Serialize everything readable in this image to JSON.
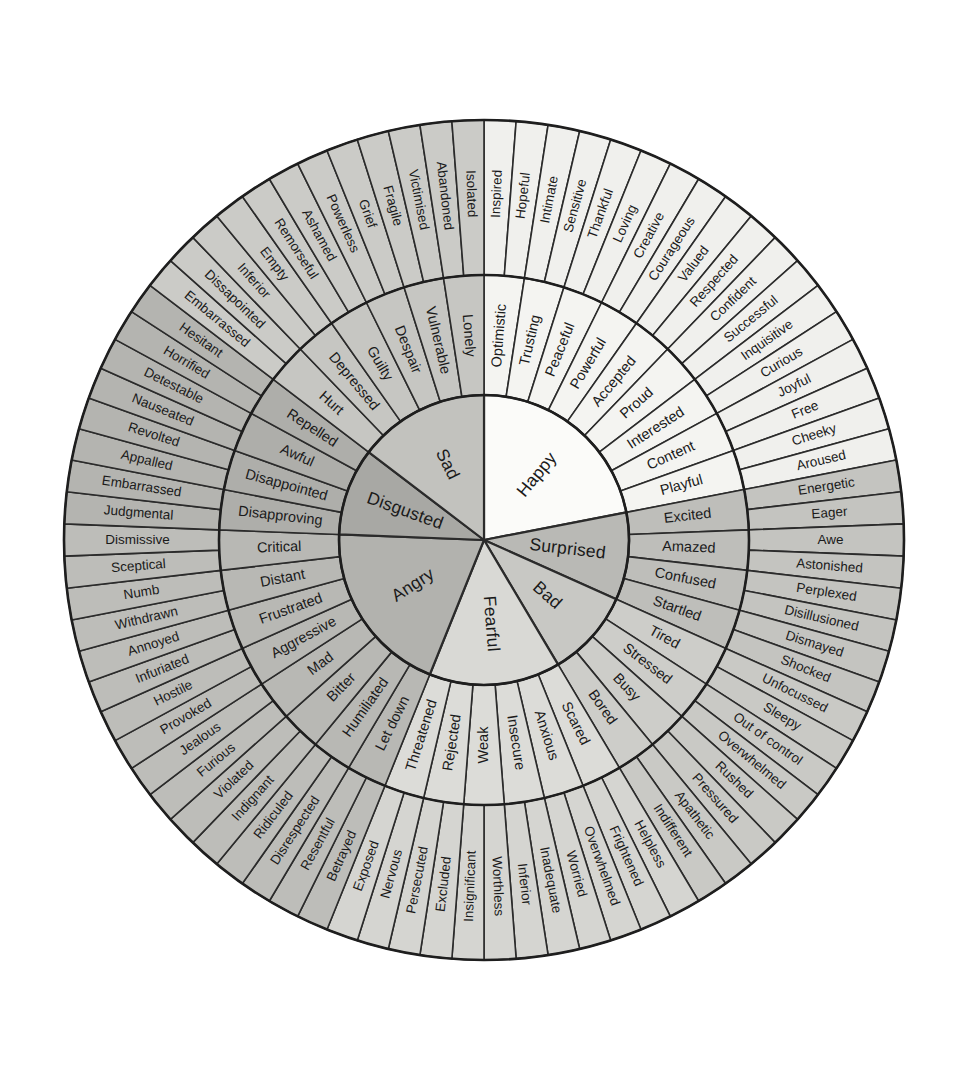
{
  "diagram": {
    "type": "radial-hierarchy",
    "rings": [
      "core",
      "middle",
      "outer"
    ],
    "center": {
      "x": 484,
      "y": 540
    },
    "radii": {
      "core": 145,
      "middle": 265,
      "outer": 420
    },
    "start_angle_deg": -90,
    "palette": {
      "happy": "#fbfbf9",
      "surprised": "#b9b9b5",
      "bad": "#c8c8c4",
      "fearful": "#d9d9d5",
      "angry": "#b2b2ae",
      "disgusted": "#a8a8a4",
      "sad": "#c2c2be",
      "stroke": "#2b2b2b",
      "background": "#ffffff",
      "text": "#1a1a1a"
    },
    "sectors": [
      {
        "core": "Happy",
        "fill": "#fbfbf9",
        "middle_fill": "#f4f4f1",
        "outer_fill": "#f0f0ed",
        "middle": [
          {
            "label": "Optimistic",
            "outer": [
              "Inspired",
              "Hopeful"
            ]
          },
          {
            "label": "Trusting",
            "outer": [
              "Intimate",
              "Sensitive"
            ]
          },
          {
            "label": "Peaceful",
            "outer": [
              "Thankful",
              "Loving"
            ]
          },
          {
            "label": "Powerful",
            "outer": [
              "Creative",
              "Courageous"
            ]
          },
          {
            "label": "Accepted",
            "outer": [
              "Valued",
              "Respected"
            ]
          },
          {
            "label": "Proud",
            "outer": [
              "Confident",
              "Successful"
            ]
          },
          {
            "label": "Interested",
            "outer": [
              "Inquisitive",
              "Curious"
            ]
          },
          {
            "label": "Content",
            "outer": [
              "Joyful",
              "Free"
            ]
          },
          {
            "label": "Playful",
            "outer": [
              "Cheeky",
              "Aroused"
            ]
          }
        ]
      },
      {
        "core": "Surprised",
        "fill": "#b9b9b5",
        "middle_fill": "#bebeba",
        "outer_fill": "#c4c4c0",
        "middle": [
          {
            "label": "Excited",
            "outer": [
              "Energetic",
              "Eager"
            ]
          },
          {
            "label": "Amazed",
            "outer": [
              "Awe",
              "Astonished"
            ]
          },
          {
            "label": "Confused",
            "outer": [
              "Perplexed",
              "Disillusioned"
            ]
          },
          {
            "label": "Startled",
            "outer": [
              "Dismayed",
              "Shocked"
            ]
          }
        ]
      },
      {
        "core": "Bad",
        "fill": "#c8c8c4",
        "middle_fill": "#cdcdc9",
        "outer_fill": "#c9c9c5",
        "middle": [
          {
            "label": "Tired",
            "outer": [
              "Unfocussed",
              "Sleepy"
            ]
          },
          {
            "label": "Stressed",
            "outer": [
              "Out of control",
              "Overwhelmed"
            ]
          },
          {
            "label": "Busy",
            "outer": [
              "Rushed",
              "Pressured"
            ]
          },
          {
            "label": "Bored",
            "outer": [
              "Apathetic",
              "Indifferent"
            ]
          }
        ]
      },
      {
        "core": "Fearful",
        "fill": "#d9d9d5",
        "middle_fill": "#dcdcd8",
        "outer_fill": "#d5d5d1",
        "middle": [
          {
            "label": "Scared",
            "outer": [
              "Helpless",
              "Frightened"
            ]
          },
          {
            "label": "Anxious",
            "outer": [
              "Overwhelmed",
              "Worried"
            ]
          },
          {
            "label": "Insecure",
            "outer": [
              "Inadequate",
              "Inferior"
            ]
          },
          {
            "label": "Weak",
            "outer": [
              "Worthless",
              "Insignificant"
            ]
          },
          {
            "label": "Rejected",
            "outer": [
              "Excluded",
              "Persecuted"
            ]
          },
          {
            "label": "Threatened",
            "outer": [
              "Nervous",
              "Exposed"
            ]
          }
        ]
      },
      {
        "core": "Angry",
        "fill": "#b2b2ae",
        "middle_fill": "#b8b8b4",
        "outer_fill": "#bdbdb9",
        "middle": [
          {
            "label": "Let down",
            "outer": [
              "Betrayed",
              "Resentful"
            ]
          },
          {
            "label": "Humiliated",
            "outer": [
              "Disrespected",
              "Ridiculed"
            ]
          },
          {
            "label": "Bitter",
            "outer": [
              "Indignant",
              "Violated"
            ]
          },
          {
            "label": "Mad",
            "outer": [
              "Furious",
              "Jealous"
            ]
          },
          {
            "label": "Aggressive",
            "outer": [
              "Provoked",
              "Hostile"
            ]
          },
          {
            "label": "Frustrated",
            "outer": [
              "Infuriated",
              "Annoyed"
            ]
          },
          {
            "label": "Distant",
            "outer": [
              "Withdrawn",
              "Numb"
            ]
          },
          {
            "label": "Critical",
            "outer": [
              "Sceptical",
              "Dismissive"
            ]
          }
        ]
      },
      {
        "core": "Disgusted",
        "fill": "#a8a8a4",
        "middle_fill": "#aeaeaa",
        "outer_fill": "#b4b4b0",
        "middle": [
          {
            "label": "Disapproving",
            "outer": [
              "Judgmental",
              "Embarrassed"
            ]
          },
          {
            "label": "Disappointed",
            "outer": [
              "Appalled",
              "Revolted"
            ]
          },
          {
            "label": "Awful",
            "outer": [
              "Nauseated",
              "Detestable"
            ]
          },
          {
            "label": "Repelled",
            "outer": [
              "Horrified",
              "Hesitant"
            ]
          }
        ]
      },
      {
        "core": "Sad",
        "fill": "#c2c2be",
        "middle_fill": "#c6c6c2",
        "outer_fill": "#cbcbc7",
        "middle": [
          {
            "label": "Hurt",
            "outer": [
              "Embarrassed",
              "Dissapointed"
            ]
          },
          {
            "label": "Depressed",
            "outer": [
              "Inferior",
              "Empty"
            ]
          },
          {
            "label": "Guilty",
            "outer": [
              "Remorseful",
              "Ashamed"
            ]
          },
          {
            "label": "Despair",
            "outer": [
              "Powerless",
              "Grief"
            ]
          },
          {
            "label": "Vulnerable",
            "outer": [
              "Fragile",
              "Victimised"
            ]
          },
          {
            "label": "Lonely",
            "outer": [
              "Abandoned",
              "Isolated"
            ]
          }
        ]
      }
    ]
  }
}
